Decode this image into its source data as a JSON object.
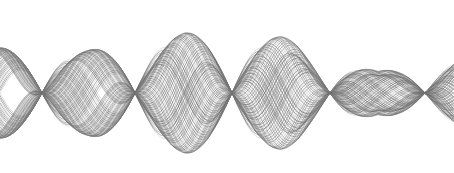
{
  "figure": {
    "title": "",
    "width": 454,
    "height": 173,
    "background_color": "#ffffff"
  },
  "chart_data": {
    "type": "line",
    "title": "",
    "subtitle": "",
    "xlabel": "",
    "ylabel": "",
    "xlim": [
      0,
      454
    ],
    "ylim": [
      173,
      0
    ],
    "grid": false,
    "legend": false,
    "legend_position": "none",
    "axes_visible": false,
    "tick_labels_x": [],
    "tick_labels_y": [],
    "baseline_y": 93,
    "series_count": 44,
    "line_color": "#6b6b6b",
    "line_color_light": "#a8a8a8",
    "line_width": 0.7,
    "line_opacity": 0.72,
    "nodes_x": [
      42,
      135,
      232,
      330,
      425
    ],
    "antinodes_x": [
      88,
      184,
      281,
      378
    ],
    "antinode_amplitudes": [
      52,
      70,
      64,
      24
    ],
    "envelope": {
      "left_edge_spread": 58,
      "right_edge_spread": 40,
      "max_top_y": 20,
      "max_bottom_y": 160,
      "decay": "amplitude decreases from left/center toward right"
    },
    "series": [
      {
        "name": "wave-00",
        "frequency": 0.0323,
        "phase": 0.0,
        "amplitude": 70
      },
      {
        "name": "wave-01",
        "frequency": 0.0325,
        "phase": 0.045,
        "amplitude": 69
      },
      {
        "name": "wave-02",
        "frequency": 0.0327,
        "phase": 0.09,
        "amplitude": 68
      },
      {
        "name": "wave-03",
        "frequency": 0.0329,
        "phase": 0.135,
        "amplitude": 67
      },
      {
        "name": "wave-04",
        "frequency": 0.0331,
        "phase": 0.18,
        "amplitude": 66
      },
      {
        "name": "wave-05",
        "frequency": 0.0333,
        "phase": 0.225,
        "amplitude": 65
      },
      {
        "name": "wave-06",
        "frequency": 0.0335,
        "phase": 0.27,
        "amplitude": 64
      },
      {
        "name": "wave-07",
        "frequency": 0.0337,
        "phase": 0.315,
        "amplitude": 63
      },
      {
        "name": "wave-08",
        "frequency": 0.0339,
        "phase": 0.36,
        "amplitude": 62
      },
      {
        "name": "wave-09",
        "frequency": 0.0341,
        "phase": 0.405,
        "amplitude": 61
      },
      {
        "name": "wave-10",
        "frequency": 0.0343,
        "phase": 0.45,
        "amplitude": 60
      },
      {
        "name": "wave-11",
        "frequency": 0.0345,
        "phase": 0.495,
        "amplitude": 59
      },
      {
        "name": "wave-12",
        "frequency": 0.0347,
        "phase": 0.54,
        "amplitude": 58
      },
      {
        "name": "wave-13",
        "frequency": 0.0349,
        "phase": 0.585,
        "amplitude": 57
      },
      {
        "name": "wave-14",
        "frequency": 0.0351,
        "phase": 0.63,
        "amplitude": 56
      },
      {
        "name": "wave-15",
        "frequency": 0.0353,
        "phase": 0.675,
        "amplitude": 55
      },
      {
        "name": "wave-16",
        "frequency": 0.0355,
        "phase": 0.72,
        "amplitude": 54
      },
      {
        "name": "wave-17",
        "frequency": 0.0357,
        "phase": 0.765,
        "amplitude": 53
      },
      {
        "name": "wave-18",
        "frequency": 0.0359,
        "phase": 0.81,
        "amplitude": 52
      },
      {
        "name": "wave-19",
        "frequency": 0.0361,
        "phase": 0.855,
        "amplitude": 51
      },
      {
        "name": "wave-20",
        "frequency": 0.0363,
        "phase": 0.9,
        "amplitude": 50
      },
      {
        "name": "wave-21",
        "frequency": 0.0365,
        "phase": 0.945,
        "amplitude": 49
      },
      {
        "name": "wave-22",
        "frequency": 0.0367,
        "phase": 0.99,
        "amplitude": 48
      },
      {
        "name": "wave-23",
        "frequency": 0.0369,
        "phase": 1.035,
        "amplitude": 47
      },
      {
        "name": "wave-24",
        "frequency": 0.0371,
        "phase": 1.08,
        "amplitude": 46
      },
      {
        "name": "wave-25",
        "frequency": 0.0373,
        "phase": 1.125,
        "amplitude": 45
      },
      {
        "name": "wave-26",
        "frequency": 0.0375,
        "phase": 1.17,
        "amplitude": 44
      },
      {
        "name": "wave-27",
        "frequency": 0.0377,
        "phase": 1.215,
        "amplitude": 43
      },
      {
        "name": "wave-28",
        "frequency": 0.0379,
        "phase": 1.26,
        "amplitude": 42
      },
      {
        "name": "wave-29",
        "frequency": 0.0381,
        "phase": 1.305,
        "amplitude": 41
      },
      {
        "name": "wave-30",
        "frequency": 0.0383,
        "phase": 1.35,
        "amplitude": 40
      },
      {
        "name": "wave-31",
        "frequency": 0.0385,
        "phase": 1.395,
        "amplitude": 39
      },
      {
        "name": "wave-32",
        "frequency": 0.0387,
        "phase": 1.44,
        "amplitude": 38
      },
      {
        "name": "wave-33",
        "frequency": 0.0389,
        "phase": 1.485,
        "amplitude": 37
      },
      {
        "name": "wave-34",
        "frequency": 0.0391,
        "phase": 1.53,
        "amplitude": 36
      },
      {
        "name": "wave-35",
        "frequency": 0.0393,
        "phase": 1.575,
        "amplitude": 35
      },
      {
        "name": "wave-36",
        "frequency": 0.0395,
        "phase": 1.62,
        "amplitude": 34
      },
      {
        "name": "wave-37",
        "frequency": 0.0397,
        "phase": 1.665,
        "amplitude": 33
      },
      {
        "name": "wave-38",
        "frequency": 0.0399,
        "phase": 1.71,
        "amplitude": 32
      },
      {
        "name": "wave-39",
        "frequency": 0.0401,
        "phase": 1.755,
        "amplitude": 31
      },
      {
        "name": "wave-40",
        "frequency": 0.0403,
        "phase": 1.8,
        "amplitude": 30
      },
      {
        "name": "wave-41",
        "frequency": 0.0405,
        "phase": 1.845,
        "amplitude": 29
      },
      {
        "name": "wave-42",
        "frequency": 0.0407,
        "phase": 1.89,
        "amplitude": 28
      },
      {
        "name": "wave-43",
        "frequency": 0.0409,
        "phase": 1.935,
        "amplitude": 27
      }
    ]
  }
}
